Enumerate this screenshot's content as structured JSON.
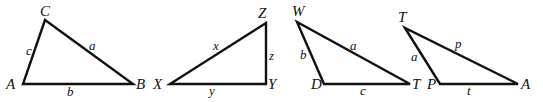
{
  "figure": {
    "stroke_color": "#111111",
    "background": "#ffffff",
    "triangles": [
      {
        "id": "triangle-abc",
        "vertices": [
          {
            "label": "C",
            "x": 45,
            "y": 20,
            "lx": 40,
            "ly": 16
          },
          {
            "label": "A",
            "x": 23,
            "y": 84,
            "lx": 6,
            "ly": 89
          },
          {
            "label": "B",
            "x": 133,
            "y": 84,
            "lx": 136,
            "ly": 89
          }
        ],
        "sides": [
          {
            "label": "c",
            "lx": 26,
            "ly": 55
          },
          {
            "label": "a",
            "lx": 89,
            "ly": 50
          },
          {
            "label": "b",
            "lx": 67,
            "ly": 96
          }
        ]
      },
      {
        "id": "triangle-xyz",
        "vertices": [
          {
            "label": "Z",
            "x": 266,
            "y": 23,
            "lx": 258,
            "ly": 18
          },
          {
            "label": "X",
            "x": 170,
            "y": 84,
            "lx": 153,
            "ly": 89
          },
          {
            "label": "Y",
            "x": 266,
            "y": 84,
            "lx": 268,
            "ly": 89
          }
        ],
        "sides": [
          {
            "label": "x",
            "lx": 213,
            "ly": 50
          },
          {
            "label": "z",
            "lx": 269,
            "ly": 60
          },
          {
            "label": "y",
            "lx": 209,
            "ly": 95
          }
        ]
      },
      {
        "id": "triangle-wdt",
        "vertices": [
          {
            "label": "W",
            "x": 297,
            "y": 22,
            "lx": 292,
            "ly": 16
          },
          {
            "label": "D",
            "x": 324,
            "y": 84,
            "lx": 311,
            "ly": 89
          },
          {
            "label": "T",
            "x": 410,
            "y": 84,
            "lx": 412,
            "ly": 89
          }
        ],
        "sides": [
          {
            "label": "b",
            "lx": 300,
            "ly": 59
          },
          {
            "label": "a",
            "lx": 350,
            "ly": 50
          },
          {
            "label": "c",
            "lx": 360,
            "ly": 95
          }
        ]
      },
      {
        "id": "triangle-tpa",
        "vertices": [
          {
            "label": "T",
            "x": 405,
            "y": 28,
            "lx": 398,
            "ly": 22
          },
          {
            "label": "P",
            "x": 440,
            "y": 84,
            "lx": 427,
            "ly": 89
          },
          {
            "label": "A",
            "x": 518,
            "y": 84,
            "lx": 521,
            "ly": 89
          }
        ],
        "sides": [
          {
            "label": "a",
            "lx": 411,
            "ly": 61
          },
          {
            "label": "p",
            "lx": 455,
            "ly": 48
          },
          {
            "label": "t",
            "lx": 467,
            "ly": 95
          }
        ]
      }
    ]
  }
}
